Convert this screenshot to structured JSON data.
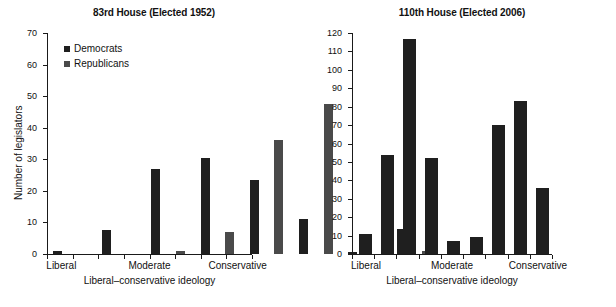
{
  "figure": {
    "background": "#ffffff",
    "bar_color_democrat": "#1f1f1f",
    "bar_color_republican": "#4a4a4a"
  },
  "panels": [
    {
      "id": "left",
      "title": "83rd House (Elected 1952)",
      "xlabel": "Liberal–conservative ideology",
      "ylabel": "Number of legislators",
      "legend": {
        "position": "top-left",
        "items": [
          {
            "label": "Democrats",
            "color": "#1f1f1f"
          },
          {
            "label": "Republicans",
            "color": "#4a4a4a"
          }
        ]
      },
      "xcategories": [
        "Liberal",
        "Moderate",
        "Conservative"
      ]
    },
    {
      "id": "right",
      "title": "110th House (Elected 2006)",
      "xlabel": "Liberal–conservative ideology",
      "ylabel": "Number of legislators",
      "xcategories": [
        "Liberal",
        "Moderate",
        "Conservative"
      ]
    }
  ],
  "chart_data": [
    {
      "type": "bar",
      "title": "83rd House (Elected 1952)",
      "xlabel": "Liberal–conservative ideology",
      "ylabel": "Number of legislators",
      "ylim": [
        0,
        70
      ],
      "yticks": [
        0,
        10,
        20,
        30,
        40,
        50,
        60,
        70
      ],
      "grid": false,
      "legend_position": "upper left",
      "bins": 10,
      "categories": [
        "Liberal",
        "Moderate",
        "Conservative"
      ],
      "category_bin_index": [
        0,
        4.5,
        9
      ],
      "series": [
        {
          "name": "Democrats",
          "color": "#1f1f1f",
          "values": [
            1,
            7.5,
            27,
            30.5,
            23.5,
            11,
            0.5,
            8,
            0,
            0
          ]
        },
        {
          "name": "Republicans",
          "color": "#4a4a4a",
          "values": [
            0,
            0,
            1,
            0,
            7,
            36,
            47.5,
            0,
            1,
            0
          ]
        }
      ],
      "bar_sequence": [
        {
          "bin": 0,
          "series": "Democrats",
          "value": 1
        },
        {
          "bin": 0,
          "series": "Republicans",
          "value": 0
        },
        {
          "bin": 1,
          "series": "Democrats",
          "value": 7.5
        },
        {
          "bin": 1,
          "series": "Republicans",
          "value": 0
        },
        {
          "bin": 2,
          "series": "Democrats",
          "value": 27
        },
        {
          "bin": 2,
          "series": "Republicans",
          "value": 1
        },
        {
          "bin": 3,
          "series": "Democrats",
          "value": 30.5
        },
        {
          "bin": 3,
          "series": "Republicans",
          "value": 7
        },
        {
          "bin": 4,
          "series": "Democrats",
          "value": 23.5
        },
        {
          "bin": 4,
          "series": "Republicans",
          "value": 36
        },
        {
          "bin": 5,
          "series": "Democrats",
          "value": 11
        },
        {
          "bin": 5,
          "series": "Republicans",
          "value": 47.5
        },
        {
          "bin": 6,
          "series": "Democrats",
          "value": 0.5
        },
        {
          "bin": 6,
          "series": "Republicans",
          "value": 0
        },
        {
          "bin": 7,
          "series": "Democrats",
          "value": 8
        },
        {
          "bin": 7,
          "series": "Republicans",
          "value": 1
        }
      ]
    },
    {
      "type": "bar",
      "title": "110th House (Elected 2006)",
      "xlabel": "Liberal–conservative ideology",
      "ylabel": "Number of legislators",
      "ylim": [
        0,
        120
      ],
      "yticks": [
        0,
        10,
        20,
        30,
        40,
        50,
        60,
        70,
        80,
        90,
        100,
        110,
        120
      ],
      "grid": false,
      "categories": [
        "Liberal",
        "Moderate",
        "Conservative"
      ],
      "category_bin_index": [
        0,
        4,
        7
      ],
      "series": [
        {
          "name": "Legislators",
          "color": "#1f1f1f",
          "values": [
            11,
            54,
            116.5,
            52,
            7,
            9,
            70,
            83,
            36
          ]
        }
      ]
    }
  ]
}
